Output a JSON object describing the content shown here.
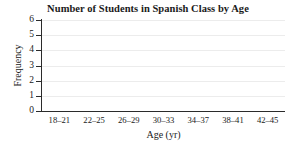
{
  "chart_data": {
    "type": "bar",
    "title": "Number of Students in Spanish Class by Age",
    "xlabel": "Age (yr)",
    "ylabel": "Frequency",
    "categories": [
      "18–21",
      "22–25",
      "26–29",
      "30–33",
      "34–37",
      "38–41",
      "42–45"
    ],
    "values": [
      0,
      0,
      0,
      0,
      0,
      0,
      0
    ],
    "ylim": [
      0,
      6
    ],
    "ytick_labels": [
      "0",
      "1",
      "2",
      "3",
      "4",
      "5",
      "6"
    ],
    "yticks": [
      0,
      1,
      2,
      3,
      4,
      5,
      6
    ],
    "grid": "horizontal",
    "legend": "none",
    "colors": {
      "background": "#ffffff",
      "axis": "#2b2b2b",
      "gridline": "#ececec",
      "text": "#1a1a1a",
      "bar": "#4a6f9e"
    }
  }
}
